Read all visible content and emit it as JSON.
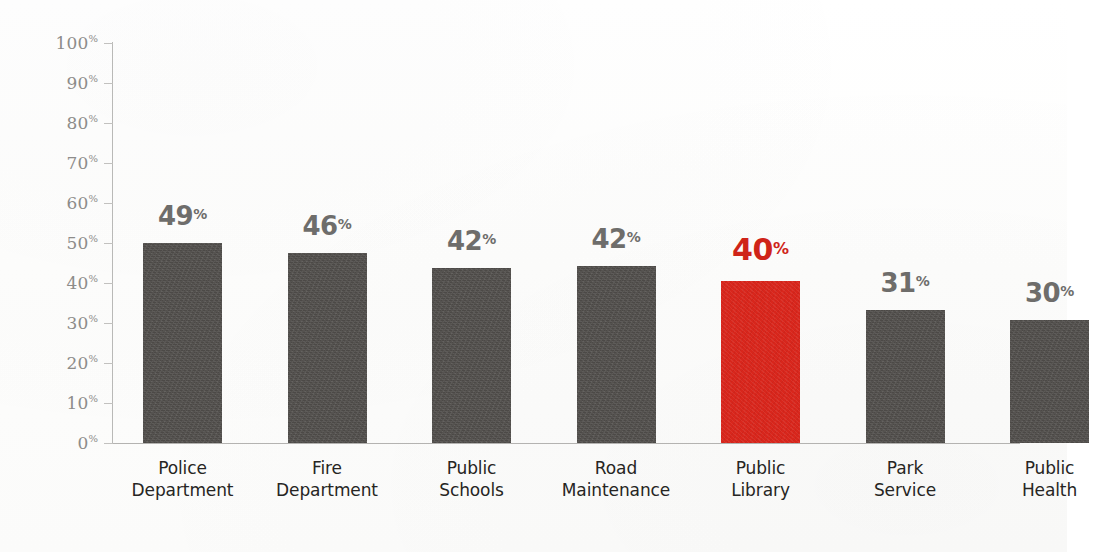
{
  "chart_data": {
    "type": "bar",
    "title": "",
    "subtitle": "",
    "xlabel": "",
    "ylabel": "",
    "ylim": [
      0,
      100
    ],
    "grid": false,
    "legend": "none",
    "orientation": "vertical",
    "categories": [
      "Police Department",
      "Fire Department",
      "Public Schools",
      "Road Maintenance",
      "Public Library",
      "Park Service",
      "Public Health"
    ],
    "values": [
      49,
      46,
      42,
      42,
      40,
      31,
      30
    ],
    "value_labels": [
      "49%",
      "46%",
      "42%",
      "42%",
      "40%",
      "31%",
      "30%"
    ],
    "highlighted_index": 4,
    "highlighted_category": "Public Library",
    "y_tick_labels": [
      "0%",
      "10%",
      "20%",
      "30%",
      "40%",
      "50%",
      "60%",
      "70%",
      "80%",
      "90%",
      "100%"
    ],
    "y_ticks": [
      0,
      10,
      20,
      30,
      40,
      50,
      60,
      70,
      80,
      90,
      100
    ],
    "colors": {
      "bar_default": "#504d4a",
      "bar_highlight": "#d8261c",
      "value_label_default": "#6e6d6b",
      "value_label_highlight": "#cf2418",
      "category_label": "#262523",
      "axis_line": "#b9b9b7",
      "tick_label": "#8d8c8a",
      "background": "#fefefe"
    }
  },
  "axis": {
    "y": {
      "ticks": [
        {
          "label_num": "100",
          "pct": "%",
          "value": 100
        },
        {
          "label_num": "90",
          "pct": "%",
          "value": 90
        },
        {
          "label_num": "80",
          "pct": "%",
          "value": 80
        },
        {
          "label_num": "70",
          "pct": "%",
          "value": 70
        },
        {
          "label_num": "60",
          "pct": "%",
          "value": 60
        },
        {
          "label_num": "50",
          "pct": "%",
          "value": 50
        },
        {
          "label_num": "40",
          "pct": "%",
          "value": 40
        },
        {
          "label_num": "30",
          "pct": "%",
          "value": 30
        },
        {
          "label_num": "20",
          "pct": "%",
          "value": 20
        },
        {
          "label_num": "10",
          "pct": "%",
          "value": 10
        },
        {
          "label_num": "0",
          "pct": "%",
          "value": 0
        }
      ]
    }
  },
  "bars": [
    {
      "category_line1": "Police",
      "category_line2": "Department",
      "value_num": "49",
      "value_pct": "%",
      "value": 49,
      "draw_pct": 50.0,
      "highlight": false
    },
    {
      "category_line1": "Fire",
      "category_line2": "Department",
      "value_num": "46",
      "value_pct": "%",
      "value": 46,
      "draw_pct": 47.5,
      "highlight": false
    },
    {
      "category_line1": "Public",
      "category_line2": "Schools",
      "value_num": "42",
      "value_pct": "%",
      "value": 42,
      "draw_pct": 43.8,
      "highlight": false
    },
    {
      "category_line1": "Road",
      "category_line2": "Maintenance",
      "value_num": "42",
      "value_pct": "%",
      "value": 42,
      "draw_pct": 44.3,
      "highlight": false
    },
    {
      "category_line1": "Public",
      "category_line2": "Library",
      "value_num": "40",
      "value_pct": "%",
      "value": 40,
      "draw_pct": 40.5,
      "highlight": true
    },
    {
      "category_line1": "Park",
      "category_line2": "Service",
      "value_num": "31",
      "value_pct": "%",
      "value": 31,
      "draw_pct": 33.3,
      "highlight": false
    },
    {
      "category_line1": "Public",
      "category_line2": "Health",
      "value_num": "30",
      "value_pct": "%",
      "value": 30,
      "draw_pct": 30.8,
      "highlight": false
    }
  ]
}
